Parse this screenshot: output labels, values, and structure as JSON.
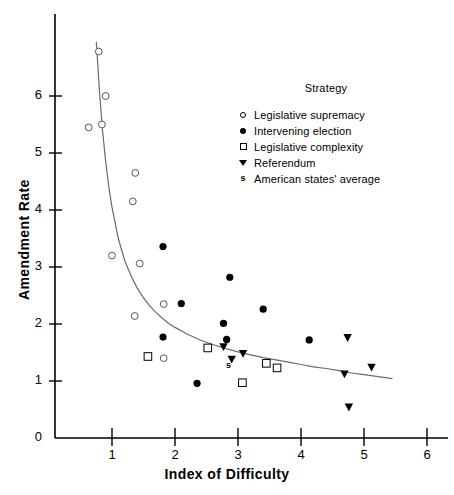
{
  "chart_data": {
    "type": "scatter",
    "title": "",
    "xlabel": "Index of Difficulty",
    "ylabel": "Amendment Rate",
    "xlim": [
      0,
      6.4
    ],
    "ylim": [
      0,
      6.95
    ],
    "xticks": [
      "1",
      "2",
      "3",
      "4",
      "5",
      "6"
    ],
    "xtick_values": [
      1,
      2,
      3,
      4,
      5,
      6
    ],
    "yticks": [
      "0",
      "1",
      "2",
      "3",
      "4",
      "5",
      "6"
    ],
    "ytick_values": [
      0,
      1,
      2,
      3,
      4,
      5,
      6
    ],
    "grid": false,
    "legend_position": "upper-right-inside",
    "legend_title": "Strategy",
    "series": [
      {
        "name": "Legislative supremacy",
        "marker": "open-circle",
        "color": "#000000",
        "points": [
          [
            0.79,
            6.78
          ],
          [
            0.9,
            6.0
          ],
          [
            0.63,
            5.45
          ],
          [
            0.84,
            5.5
          ],
          [
            1.37,
            4.65
          ],
          [
            1.33,
            4.15
          ],
          [
            1.0,
            3.2
          ],
          [
            1.44,
            3.06
          ],
          [
            1.82,
            2.35
          ],
          [
            1.36,
            2.14
          ],
          [
            1.82,
            1.4
          ]
        ]
      },
      {
        "name": "Intervening election",
        "marker": "filled-circle",
        "color": "#000000",
        "points": [
          [
            1.81,
            3.36
          ],
          [
            2.87,
            2.82
          ],
          [
            2.1,
            2.36
          ],
          [
            3.4,
            2.26
          ],
          [
            2.77,
            2.01
          ],
          [
            1.81,
            1.77
          ],
          [
            2.82,
            1.73
          ],
          [
            4.13,
            1.72
          ],
          [
            2.35,
            0.96
          ]
        ]
      },
      {
        "name": "Legislative complexity",
        "marker": "open-square",
        "color": "#000000",
        "points": [
          [
            1.57,
            1.43
          ],
          [
            2.52,
            1.58
          ],
          [
            3.45,
            1.31
          ],
          [
            3.62,
            1.23
          ],
          [
            3.07,
            0.97
          ]
        ]
      },
      {
        "name": "Referendum",
        "marker": "triangle-down",
        "color": "#000000",
        "points": [
          [
            2.77,
            1.6
          ],
          [
            3.08,
            1.48
          ],
          [
            2.9,
            1.38
          ],
          [
            4.74,
            1.76
          ],
          [
            5.12,
            1.24
          ],
          [
            4.69,
            1.12
          ],
          [
            4.76,
            0.54
          ]
        ]
      },
      {
        "name": "American states' average",
        "marker": "s-glyph",
        "color": "#000000",
        "points": [
          [
            2.85,
            1.28
          ]
        ]
      }
    ],
    "fit_curve": {
      "name": "fitted power curve",
      "color": "#6b6b6b",
      "x_range": [
        0.75,
        5.45
      ],
      "points": [
        [
          0.75,
          6.95
        ],
        [
          0.8,
          6.1
        ],
        [
          0.85,
          5.4
        ],
        [
          0.9,
          4.85
        ],
        [
          0.95,
          4.4
        ],
        [
          1.0,
          4.05
        ],
        [
          1.1,
          3.5
        ],
        [
          1.2,
          3.12
        ],
        [
          1.3,
          2.85
        ],
        [
          1.4,
          2.63
        ],
        [
          1.5,
          2.46
        ],
        [
          1.6,
          2.32
        ],
        [
          1.7,
          2.2
        ],
        [
          1.8,
          2.1
        ],
        [
          1.9,
          2.01
        ],
        [
          2.0,
          1.94
        ],
        [
          2.2,
          1.82
        ],
        [
          2.4,
          1.72
        ],
        [
          2.6,
          1.64
        ],
        [
          2.8,
          1.57
        ],
        [
          3.0,
          1.51
        ],
        [
          3.2,
          1.46
        ],
        [
          3.4,
          1.41
        ],
        [
          3.6,
          1.37
        ],
        [
          3.8,
          1.33
        ],
        [
          4.0,
          1.29
        ],
        [
          4.2,
          1.25
        ],
        [
          4.4,
          1.22
        ],
        [
          4.6,
          1.18
        ],
        [
          4.8,
          1.14
        ],
        [
          5.0,
          1.11
        ],
        [
          5.2,
          1.08
        ],
        [
          5.45,
          1.04
        ]
      ]
    }
  },
  "axes": {
    "x_title": "Index of Difficulty",
    "y_title": "Amendment Rate"
  },
  "legend": {
    "title": "Strategy",
    "items": [
      {
        "label": "Legislative supremacy",
        "marker": "open-circle"
      },
      {
        "label": "Intervening election",
        "marker": "filled-circle"
      },
      {
        "label": "Legislative complexity",
        "marker": "open-square"
      },
      {
        "label": "Referendum",
        "marker": "triangle-down"
      },
      {
        "label": "American states' average",
        "marker": "s-glyph"
      }
    ]
  },
  "colors": {
    "ink": "#000000",
    "curve": "#6b6b6b",
    "background": "#ffffff"
  }
}
